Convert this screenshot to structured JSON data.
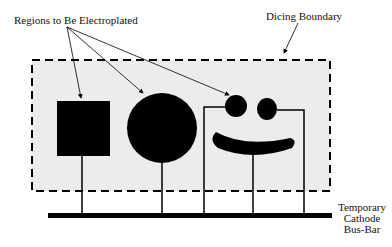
{
  "labels": {
    "regions": "Regions to Be Electroplated",
    "dicing": "Dicing Boundary",
    "busbar_line1": "Temporary",
    "busbar_line2": "Cathode",
    "busbar_line3": "Bus-Bar"
  },
  "colors": {
    "background": "#ffffff",
    "die_area": "#ececec",
    "ink": "#000000"
  },
  "shapes": [
    "square",
    "large-circle",
    "left-eye-circle",
    "right-eye-circle",
    "smile-curve"
  ]
}
